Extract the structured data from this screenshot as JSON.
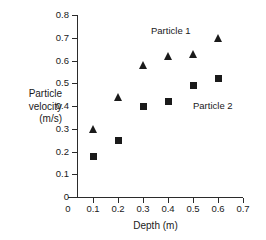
{
  "chart_data": {
    "type": "scatter",
    "title": "",
    "xlabel": "Depth (m)",
    "ylabel": "Particle velocity (m/s)",
    "ylabel_lines": [
      "Particle",
      "velocity",
      "(m/s)"
    ],
    "xlim": [
      0,
      0.7
    ],
    "ylim": [
      0,
      0.8
    ],
    "xticks": [
      "0",
      "0.1",
      "0.2",
      "0.3",
      "0.4",
      "0.5",
      "0.6",
      "0.7"
    ],
    "xtick_values": [
      0,
      0.1,
      0.2,
      0.3,
      0.4,
      0.5,
      0.6,
      0.7
    ],
    "yticks": [
      "0",
      "0.1",
      "0.2",
      "0.3",
      "0.4",
      "0.5",
      "0.6",
      "0.7",
      "0.8"
    ],
    "ytick_values": [
      0,
      0.1,
      0.2,
      0.3,
      0.4,
      0.5,
      0.6,
      0.7,
      0.8
    ],
    "grid": false,
    "legend_position": "inline-annotation",
    "series": [
      {
        "name": "Particle 1",
        "marker": "triangle",
        "color": "#1a1a1a",
        "x": [
          0.1,
          0.2,
          0.3,
          0.4,
          0.5,
          0.6
        ],
        "values": [
          0.3,
          0.44,
          0.58,
          0.62,
          0.63,
          0.7
        ]
      },
      {
        "name": "Particle 2",
        "marker": "square",
        "color": "#1a1a1a",
        "x": [
          0.1,
          0.2,
          0.3,
          0.4,
          0.5,
          0.6
        ],
        "values": [
          0.18,
          0.25,
          0.4,
          0.42,
          0.49,
          0.52
        ]
      }
    ],
    "annotations": [
      {
        "text": "Particle 1",
        "x": 0.33,
        "y": 0.735
      },
      {
        "text": "Particle 2",
        "x": 0.5,
        "y": 0.405
      }
    ]
  },
  "axes": {
    "x_title": "Depth (m)",
    "y_title_line1": "Particle",
    "y_title_line2": "velocity",
    "y_title_line3": "(m/s)"
  },
  "colors": {
    "background": "#ffffff",
    "axis": "#2b2b2b",
    "marker": "#1a1a1a",
    "text": "#1a1a1a"
  }
}
